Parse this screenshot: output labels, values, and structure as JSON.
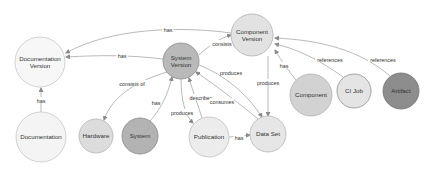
{
  "diagram": {
    "nodes": [
      {
        "id": "doc_version",
        "lines": [
          "Documentation",
          "Version"
        ],
        "cx": 40,
        "cy": 62,
        "r": 25,
        "fill": "#f7f7f7",
        "stroke": "#c8c8c8"
      },
      {
        "id": "documentation",
        "lines": [
          "Documentation"
        ],
        "cx": 41,
        "cy": 137,
        "r": 25,
        "fill": "#f4f4f4",
        "stroke": "#c8c8c8"
      },
      {
        "id": "system_version",
        "lines": [
          "System",
          "Version"
        ],
        "cx": 181,
        "cy": 61,
        "r": 18,
        "fill": "#b9b9b9",
        "stroke": "#8c8c8c"
      },
      {
        "id": "component_version",
        "lines": [
          "Component",
          "Version"
        ],
        "cx": 252,
        "cy": 35,
        "r": 21,
        "fill": "#e2e2e2",
        "stroke": "#b0b0b0"
      },
      {
        "id": "hardware",
        "lines": [
          "Hardware"
        ],
        "cx": 96,
        "cy": 136,
        "r": 17,
        "fill": "#dcdcdc",
        "stroke": "#b5b5b5"
      },
      {
        "id": "system",
        "lines": [
          "System"
        ],
        "cx": 140,
        "cy": 136,
        "r": 18,
        "fill": "#b3b3b3",
        "stroke": "#8a8a8a"
      },
      {
        "id": "publication",
        "lines": [
          "Publication"
        ],
        "cx": 209,
        "cy": 137,
        "r": 20,
        "fill": "#ececec",
        "stroke": "#c0c0c0"
      },
      {
        "id": "data_set",
        "lines": [
          "Data Set"
        ],
        "cx": 268,
        "cy": 134,
        "r": 18,
        "fill": "#e6e6e6",
        "stroke": "#b8b8b8"
      },
      {
        "id": "component",
        "lines": [
          "Component"
        ],
        "cx": 311,
        "cy": 95,
        "r": 21,
        "fill": "#d2d2d2",
        "stroke": "#b0b0b0"
      },
      {
        "id": "ci_job",
        "lines": [
          "CI Job"
        ],
        "cx": 354,
        "cy": 91,
        "r": 17,
        "fill": "#e4e4e4",
        "stroke": "#8f8f8f"
      },
      {
        "id": "artifact",
        "lines": [
          "Artifact"
        ],
        "cx": 401,
        "cy": 91,
        "r": 18,
        "fill": "#8d8d8d",
        "stroke": "#747474"
      }
    ],
    "edges": [
      {
        "from": "component_version",
        "to": "doc_version",
        "label": "has",
        "path": "M231,33 C180,26 110,28 66,53",
        "lx": 168,
        "ly": 30,
        "ax": 66,
        "ay": 53
      },
      {
        "from": "system_version",
        "to": "doc_version",
        "label": "has",
        "path": "M163,59 C130,55 100,55 66,57",
        "lx": 122,
        "ly": 56,
        "ax": 66,
        "ay": 57
      },
      {
        "from": "system_version",
        "to": "component_version",
        "label": "consists of",
        "path": "M199,55 C210,45 220,38 231,35",
        "lx": 225,
        "ly": 44,
        "ax": 231,
        "ay": 35
      },
      {
        "from": "documentation",
        "to": "doc_version",
        "label": "has",
        "path": "M41,112 L41,88",
        "lx": 41,
        "ly": 101,
        "ax": 41,
        "ay": 88
      },
      {
        "from": "system_version",
        "to": "hardware",
        "label": "consists of",
        "path": "M167,72 C140,80 112,95 104,120",
        "lx": 132,
        "ly": 84,
        "ax": 104,
        "ay": 120
      },
      {
        "from": "system",
        "to": "system_version",
        "label": "has",
        "path": "M150,121 C160,110 168,95 172,77",
        "lx": 156,
        "ly": 103,
        "ax": 172,
        "ay": 77
      },
      {
        "from": "system_version",
        "to": "publication",
        "label": "produces",
        "path": "M181,79 C181,100 185,115 193,123",
        "lx": 182,
        "ly": 113,
        "ax": 193,
        "ay": 123
      },
      {
        "from": "publication",
        "to": "system_version",
        "label": "describes",
        "path": "M202,118 C198,105 193,92 189,78",
        "lx": 201,
        "ly": 98,
        "ax": 189,
        "ay": 78
      },
      {
        "from": "system_version",
        "to": "data_set",
        "label": "produces",
        "path": "M199,65 C225,75 248,95 262,117",
        "lx": 231,
        "ly": 73,
        "ax": 262,
        "ay": 117
      },
      {
        "from": "data_set",
        "to": "system_version",
        "label": "consumes",
        "path": "M258,119 C235,100 215,85 196,72",
        "lx": 222,
        "ly": 102,
        "ax": 196,
        "ay": 72
      },
      {
        "from": "component_version",
        "to": "data_set",
        "label": "produces",
        "path": "M268,56 L268,116",
        "lx": 268,
        "ly": 83,
        "ax": 268,
        "ay": 116
      },
      {
        "from": "publication",
        "to": "data_set",
        "label": "has",
        "path": "M229,137 L250,135",
        "lx": 239,
        "ly": 138,
        "ax": 250,
        "ay": 135
      },
      {
        "from": "component",
        "to": "component_version",
        "label": "has",
        "path": "M296,80 C288,70 282,62 275,50",
        "lx": 284,
        "ly": 66,
        "ax": 275,
        "ay": 50
      },
      {
        "from": "ci_job",
        "to": "component_version",
        "label": "references",
        "path": "M343,77 C320,60 295,48 275,44",
        "lx": 330,
        "ly": 60,
        "ax": 275,
        "ay": 44
      },
      {
        "from": "artifact",
        "to": "component_version",
        "label": "references",
        "path": "M390,76 C360,50 320,40 275,38",
        "lx": 383,
        "ly": 60,
        "ax": 275,
        "ay": 38
      }
    ]
  }
}
